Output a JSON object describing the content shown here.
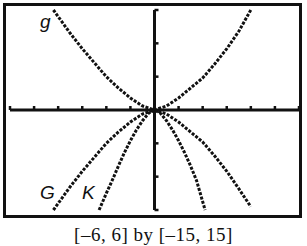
{
  "window_caption": "[–6, 6] by [–15, 15]",
  "labels": {
    "g": "g",
    "G": "G",
    "K": "K"
  },
  "colors": {
    "frame": "#111111",
    "curve": "#111111",
    "background": "#ffffff"
  },
  "chart_data": {
    "type": "line",
    "title": "",
    "xlabel": "",
    "ylabel": "",
    "xlim": [
      -6,
      6
    ],
    "ylim": [
      -15,
      15
    ],
    "xscl": 1,
    "yscl": 5,
    "grid": false,
    "legend": "curve labels placed on plot (g upper-left, G and K lower-left)",
    "caption": "[–6, 6] by [–15, 15]",
    "series": [
      {
        "name": "g",
        "x": [
          -4.2,
          -3.5,
          -3,
          -2.5,
          -2,
          -1.5,
          -1,
          -0.5,
          0,
          0.5,
          1,
          1.5,
          2,
          2.5,
          3,
          3.5,
          4.0
        ],
        "y": [
          15,
          11.5,
          9.2,
          7.1,
          5.0,
          3.3,
          1.8,
          0.6,
          0,
          0.6,
          1.8,
          3.3,
          4.8,
          6.9,
          9.2,
          11.8,
          15
        ]
      },
      {
        "name": "G",
        "x": [
          -4.2,
          -3.5,
          -3,
          -2.5,
          -2,
          -1.5,
          -1,
          -0.5,
          0,
          0.5,
          1,
          1.5,
          2,
          2.5,
          3,
          3.5,
          4.0
        ],
        "y": [
          -15,
          -11.5,
          -9.2,
          -7.1,
          -5.0,
          -3.3,
          -1.8,
          -0.6,
          0,
          -0.6,
          -1.8,
          -3.3,
          -4.8,
          -6.9,
          -9.2,
          -11.8,
          -14.5
        ]
      },
      {
        "name": "K",
        "x": [
          -2.3,
          -2,
          -1.75,
          -1.5,
          -1.25,
          -1,
          -0.75,
          -0.5,
          -0.25,
          0,
          0.25,
          0.5,
          0.75,
          1,
          1.25,
          1.5,
          1.75,
          2.1
        ],
        "y": [
          -15,
          -12.5,
          -10.5,
          -8.4,
          -6.4,
          -4.6,
          -3.0,
          -1.6,
          -0.5,
          0,
          -0.5,
          -1.6,
          -3.0,
          -4.6,
          -6.4,
          -8.4,
          -10.6,
          -15
        ]
      }
    ]
  }
}
